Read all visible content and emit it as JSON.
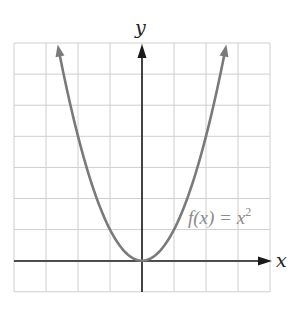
{
  "chart_data": {
    "type": "line",
    "title": "",
    "xlabel": "x",
    "ylabel": "y",
    "xlim": [
      -4,
      4
    ],
    "ylim": [
      -1,
      7
    ],
    "grid": true,
    "tick_labels": false,
    "series": [
      {
        "name": "f(x) = x^2",
        "function": "x^2",
        "x": [
          -2.6,
          -2,
          -1.5,
          -1,
          -0.5,
          0,
          0.5,
          1,
          1.5,
          2,
          2.6
        ],
        "values": [
          6.76,
          4,
          2.25,
          1,
          0.25,
          0,
          0.25,
          1,
          2.25,
          4,
          6.76
        ],
        "color": "#7a7a7a",
        "arrows_at_ends": true
      }
    ],
    "annotations": [
      {
        "text": "f(x) = x",
        "superscript": "2",
        "x": 2.8,
        "y": 1.5
      }
    ]
  },
  "labels": {
    "x_axis": "x",
    "y_axis": "y",
    "function_main": "f(x) = x",
    "function_exp": "2"
  },
  "colors": {
    "grid": "#cfcfcf",
    "axis": "#1a1a1a",
    "curve": "#7a7a7a",
    "label": "#8a8a8a"
  }
}
